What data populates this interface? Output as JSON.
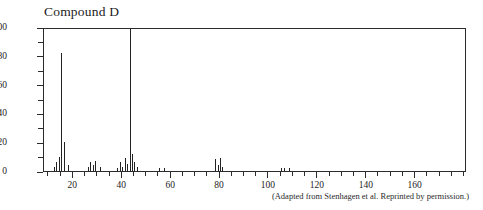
{
  "chart_data": {
    "type": "bar",
    "title": "Compound D",
    "subtitle": "",
    "xlabel": "",
    "ylabel": "",
    "xlim": [
      8,
      181
    ],
    "ylim": [
      0,
      100
    ],
    "grid": false,
    "legend": "none",
    "x_major_ticks": [
      20,
      40,
      60,
      80,
      100,
      120,
      140,
      160
    ],
    "x_major_tick_labels": [
      "20",
      "40",
      "60",
      "80",
      "100",
      "120",
      "140",
      "160"
    ],
    "x_minor_tick_step": 5,
    "y_major_ticks": [
      0,
      20,
      40,
      60,
      80,
      100
    ],
    "y_major_tick_labels": [
      "0",
      "20",
      "40",
      "60",
      "80",
      "100"
    ],
    "y_minor_ticks": [
      10,
      30,
      50,
      70,
      90
    ],
    "categories": [
      12,
      13,
      14,
      15,
      16,
      18,
      26,
      27,
      28,
      29,
      31,
      38,
      39,
      40,
      41,
      42,
      43,
      44,
      45,
      46,
      55,
      57,
      78,
      79,
      80,
      81,
      105,
      106,
      108
    ],
    "values": [
      3,
      6,
      10,
      82,
      20,
      4,
      3,
      6,
      4,
      7,
      3,
      2,
      6,
      3,
      9,
      5,
      100,
      12,
      6,
      3,
      2,
      2,
      8,
      4,
      9,
      3,
      2,
      2,
      2
    ],
    "series": [
      {
        "name": "relative abundance",
        "points": [
          {
            "mz": 12,
            "intensity": 3
          },
          {
            "mz": 13,
            "intensity": 6
          },
          {
            "mz": 14,
            "intensity": 10
          },
          {
            "mz": 15,
            "intensity": 82
          },
          {
            "mz": 16,
            "intensity": 20
          },
          {
            "mz": 18,
            "intensity": 4
          },
          {
            "mz": 26,
            "intensity": 3
          },
          {
            "mz": 27,
            "intensity": 6
          },
          {
            "mz": 28,
            "intensity": 4
          },
          {
            "mz": 29,
            "intensity": 7
          },
          {
            "mz": 31,
            "intensity": 3
          },
          {
            "mz": 38,
            "intensity": 2
          },
          {
            "mz": 39,
            "intensity": 6
          },
          {
            "mz": 40,
            "intensity": 3
          },
          {
            "mz": 41,
            "intensity": 9
          },
          {
            "mz": 42,
            "intensity": 5
          },
          {
            "mz": 43,
            "intensity": 100
          },
          {
            "mz": 44,
            "intensity": 12
          },
          {
            "mz": 45,
            "intensity": 6
          },
          {
            "mz": 46,
            "intensity": 3
          },
          {
            "mz": 55,
            "intensity": 2
          },
          {
            "mz": 57,
            "intensity": 2
          },
          {
            "mz": 78,
            "intensity": 8
          },
          {
            "mz": 79,
            "intensity": 4
          },
          {
            "mz": 80,
            "intensity": 9
          },
          {
            "mz": 81,
            "intensity": 3
          },
          {
            "mz": 105,
            "intensity": 2
          },
          {
            "mz": 106,
            "intensity": 2
          },
          {
            "mz": 108,
            "intensity": 2
          }
        ]
      }
    ],
    "base_peak": {
      "mz": 43,
      "intensity": 100
    }
  },
  "caption": "(Adapted from Stenhagen et al. Reprinted by permission.)"
}
